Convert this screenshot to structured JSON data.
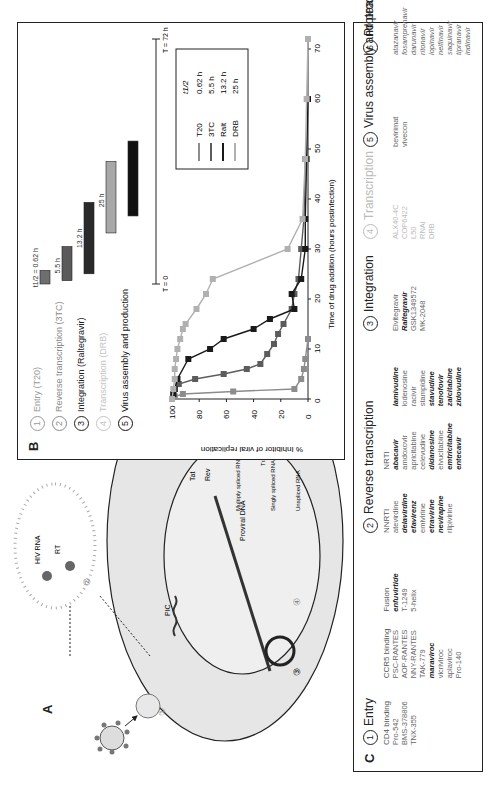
{
  "figure": {
    "orientation": "rotated 90 degrees counter-clockwise on page",
    "panel_a": {
      "label": "A",
      "labels": {
        "hiv_rna": "HIV RNA",
        "rt": "RT",
        "pic": "PIC",
        "proviral_dna": "Proviral DNA",
        "tat": "Tat",
        "rev": "Rev",
        "env": "Env",
        "translation": "Translation",
        "multiply_spliced": "Multiply spliced RNA",
        "singly_spliced": "Singly spliced RNA",
        "unspliced": "Unspliced RNA"
      },
      "step_numbers": [
        "1",
        "2",
        "3",
        "4",
        "5",
        "6"
      ]
    },
    "panel_b": {
      "label": "B",
      "steps": [
        {
          "num": "1",
          "label": "Entry (T20)",
          "color": "#9a9a9a"
        },
        {
          "num": "2",
          "label": "Reverse transcription (3TC)",
          "color": "#8a8a8a"
        },
        {
          "num": "3",
          "label": "Integration (Raltegravir)",
          "color": "#222222"
        },
        {
          "num": "4",
          "label": "Transcription (DRB)",
          "color": "#bdbdbd"
        },
        {
          "num": "5",
          "label": "Virus assembly and production",
          "color": "#111111"
        }
      ],
      "timeline": {
        "t0_label": "T = 0",
        "tend_label": "T = 72 h",
        "half_life_prefix": "t1/2 = ",
        "bars": [
          {
            "name": "T20",
            "label": "0.62 h",
            "color": "#6e6e6e",
            "start_h": 0,
            "end_h": 4
          },
          {
            "name": "3TC",
            "label": "5.5 h",
            "color": "#5a5a5a",
            "start_h": 1,
            "end_h": 11
          },
          {
            "name": "Ralt",
            "label": "13.2 h",
            "color": "#2a2a2a",
            "start_h": 3,
            "end_h": 24
          },
          {
            "name": "DRB",
            "label": "25 h",
            "color": "#a8a8a8",
            "start_h": 15,
            "end_h": 36
          },
          {
            "name": "assembly",
            "label": "",
            "color": "#111111",
            "start_h": 20,
            "end_h": 42
          }
        ]
      }
    },
    "panel_c": {
      "label": "C",
      "groups": [
        {
          "num": "1",
          "title": "Entry",
          "muted": false,
          "columns": [
            {
              "header": "CD4 binding",
              "drugs": [
                {
                  "name": "Pro-542",
                  "style": ""
                },
                {
                  "name": "BMS-378806",
                  "style": ""
                },
                {
                  "name": "TNX-355",
                  "style": ""
                }
              ]
            },
            {
              "header": "CCR5 binding",
              "drugs": [
                {
                  "name": "PSC-RANTES",
                  "style": ""
                },
                {
                  "name": "AOP-RANTES",
                  "style": ""
                },
                {
                  "name": "NNY-RANTES",
                  "style": ""
                },
                {
                  "name": "TAK-779",
                  "style": ""
                },
                {
                  "name": "maraviroc",
                  "style": "b"
                },
                {
                  "name": "vicriviroc",
                  "style": ""
                },
                {
                  "name": "aplaviroc",
                  "style": ""
                },
                {
                  "name": "Pro-140",
                  "style": ""
                }
              ]
            },
            {
              "header": "Fusion",
              "drugs": [
                {
                  "name": "enfuvirtide",
                  "style": "b"
                },
                {
                  "name": "T-1249",
                  "style": ""
                },
                {
                  "name": "5-helix",
                  "style": ""
                }
              ]
            }
          ]
        },
        {
          "num": "2",
          "title": "Reverse transcription",
          "muted": false,
          "columns": [
            {
              "header": "NNRTI",
              "drugs": [
                {
                  "name": "atevirdine",
                  "style": ""
                },
                {
                  "name": "delavirdine",
                  "style": "b"
                },
                {
                  "name": "efavirenz",
                  "style": "b"
                },
                {
                  "name": "emivirine",
                  "style": ""
                },
                {
                  "name": "etravirine",
                  "style": "b"
                },
                {
                  "name": "nevirapine",
                  "style": "b"
                },
                {
                  "name": "rilpivirine",
                  "style": ""
                }
              ]
            },
            {
              "header": "NRTI",
              "drugs": [
                {
                  "name": "abacavir",
                  "style": "b"
                },
                {
                  "name": "amdoxovir",
                  "style": ""
                },
                {
                  "name": "apricitabine",
                  "style": ""
                },
                {
                  "name": "celevudine",
                  "style": ""
                },
                {
                  "name": "didanosine",
                  "style": "b"
                },
                {
                  "name": "elvucitabine",
                  "style": ""
                },
                {
                  "name": "emtricitabine",
                  "style": "b"
                },
                {
                  "name": "entecavir",
                  "style": "b"
                }
              ]
            },
            {
              "header": "",
              "drugs": [
                {
                  "name": "lamivudine",
                  "style": "b"
                },
                {
                  "name": "lodenosine",
                  "style": ""
                },
                {
                  "name": "racivir",
                  "style": ""
                },
                {
                  "name": "stampidine",
                  "style": ""
                },
                {
                  "name": "stavudine",
                  "style": "b"
                },
                {
                  "name": "tenofovir",
                  "style": "b"
                },
                {
                  "name": "zalcitabine",
                  "style": "b"
                },
                {
                  "name": "zidovudine",
                  "style": "b"
                }
              ]
            }
          ]
        },
        {
          "num": "3",
          "title": "Integration",
          "muted": false,
          "columns": [
            {
              "header": "",
              "drugs": [
                {
                  "name": "Elvitegravir",
                  "style": ""
                },
                {
                  "name": "Raltegravir",
                  "style": "b"
                },
                {
                  "name": "GSK1349572",
                  "style": ""
                },
                {
                  "name": "MK-2048",
                  "style": ""
                }
              ]
            }
          ]
        },
        {
          "num": "4",
          "title": "Transcription",
          "muted": true,
          "columns": [
            {
              "header": "",
              "drugs": [
                {
                  "name": "ALX40-4C",
                  "style": ""
                },
                {
                  "name": "COP6422",
                  "style": ""
                },
                {
                  "name": "L50",
                  "style": ""
                },
                {
                  "name": "RNAi",
                  "style": ""
                },
                {
                  "name": "DRB",
                  "style": ""
                }
              ]
            }
          ]
        },
        {
          "num": "5",
          "title": "Virus assembly and production",
          "muted": false,
          "columns": [
            {
              "header": "",
              "drugs": [
                {
                  "name": "bevirimat",
                  "style": ""
                },
                {
                  "name": "vivecon",
                  "style": ""
                }
              ]
            }
          ]
        },
        {
          "num": "6",
          "title": "Protease processing",
          "muted": false,
          "columns": [
            {
              "header": "",
              "drugs": [
                {
                  "name": "atazanavir",
                  "style": "i"
                },
                {
                  "name": "fosamprenavir",
                  "style": "i"
                },
                {
                  "name": "darunavir",
                  "style": "i"
                },
                {
                  "name": "ritonavir",
                  "style": "i"
                },
                {
                  "name": "lopinavir",
                  "style": "i"
                },
                {
                  "name": "nelfinavir",
                  "style": "i"
                },
                {
                  "name": "saquinavir",
                  "style": "i"
                },
                {
                  "name": "tipranavir",
                  "style": "i"
                },
                {
                  "name": "indinavir",
                  "style": "i"
                }
              ]
            }
          ]
        }
      ]
    }
  },
  "chart_data": {
    "type": "scatter",
    "title": "",
    "xlabel": "Time of drug addition (hours postinfection)",
    "ylabel": "% Inhibitor of viral replication",
    "xlim": [
      0,
      72
    ],
    "ylim": [
      0,
      100
    ],
    "xticks": [
      0,
      10,
      20,
      30,
      40,
      50,
      60,
      70
    ],
    "yticks": [
      0,
      20,
      40,
      60,
      80,
      100
    ],
    "grid": false,
    "legend": {
      "placement": "top-right",
      "header": "t1/2",
      "entries": [
        {
          "name": "T20",
          "half_life": "0.62 h",
          "color": "#8c8c8c"
        },
        {
          "name": "3TC",
          "half_life": "5.5 h",
          "color": "#5c5c5c"
        },
        {
          "name": "Ralt",
          "half_life": "13.2 h",
          "color": "#1a1a1a"
        },
        {
          "name": "DRB",
          "half_life": "25 h",
          "color": "#b0b0b0"
        }
      ]
    },
    "series": [
      {
        "name": "T20",
        "color": "#8c8c8c",
        "x": [
          0,
          0.5,
          1,
          1.5,
          2,
          4,
          6,
          8,
          12
        ],
        "y": [
          100,
          98,
          92,
          55,
          10,
          5,
          3,
          2,
          0
        ]
      },
      {
        "name": "3TC",
        "color": "#5c5c5c",
        "x": [
          0,
          1,
          2,
          3,
          4,
          5,
          6,
          7,
          9,
          11,
          13,
          15,
          18,
          21,
          24,
          30,
          36,
          48
        ],
        "y": [
          100,
          99,
          98,
          95,
          83,
          62,
          45,
          35,
          30,
          25,
          22,
          18,
          12,
          10,
          7,
          5,
          3,
          2
        ]
      },
      {
        "name": "Ralt",
        "color": "#1a1a1a",
        "x": [
          0,
          1,
          2,
          4,
          8,
          10,
          12,
          14,
          16,
          18,
          21,
          24,
          30,
          36,
          48,
          60
        ],
        "y": [
          100,
          99,
          98,
          96,
          88,
          72,
          62,
          40,
          28,
          10,
          12,
          5,
          2,
          2,
          1,
          0
        ]
      },
      {
        "name": "DRB",
        "color": "#b0b0b0",
        "x": [
          0,
          2,
          4,
          6,
          8,
          10,
          12,
          14,
          15,
          18,
          21,
          24,
          30,
          36,
          48,
          60,
          72
        ],
        "y": [
          100,
          99,
          98,
          98,
          97,
          96,
          94,
          92,
          90,
          82,
          75,
          70,
          15,
          4,
          2,
          1,
          0
        ]
      }
    ]
  }
}
